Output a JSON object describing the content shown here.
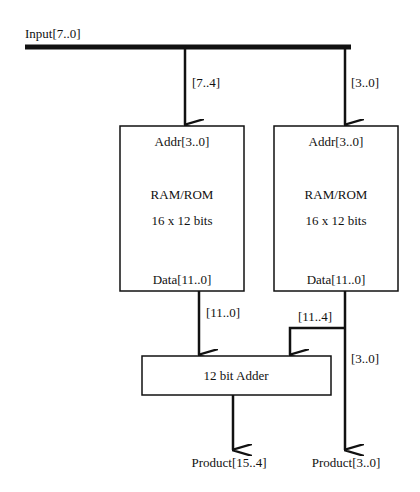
{
  "diagram": {
    "input_bus": {
      "label": "Input[7..0]"
    },
    "taps": {
      "high": "[7..4]",
      "low": "[3..0]"
    },
    "rom_left": {
      "addr": "Addr[3..0]",
      "type": "RAM/ROM",
      "size": "16 x 12 bits",
      "data": "Data[11..0]"
    },
    "rom_right": {
      "addr": "Addr[3..0]",
      "type": "RAM/ROM",
      "size": "16 x 12 bits",
      "data": "Data[11..0]"
    },
    "wires": {
      "left_out": "[11..0]",
      "right_high": "[11..4]",
      "right_low": "[3..0]"
    },
    "adder": {
      "label": "12 bit Adder"
    },
    "outputs": {
      "high": "Product[15..4]",
      "low": "Product[3..0]"
    },
    "colors": {
      "line": "#111111",
      "background": "#ffffff"
    }
  }
}
